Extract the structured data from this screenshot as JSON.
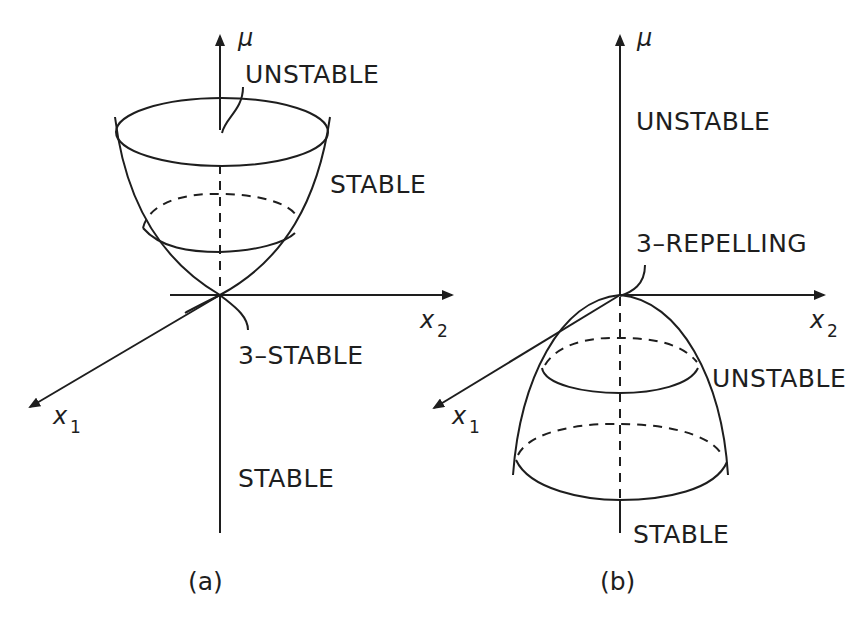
{
  "figure": {
    "panels": [
      {
        "id": "a",
        "caption": "(a)",
        "axes": {
          "vertical": "μ",
          "horizontal": "x",
          "horizontal_sub": "2",
          "depth": "x",
          "depth_sub": "1"
        },
        "labels": {
          "upper_axis": "UNSTABLE",
          "surface": "STABLE",
          "origin": "3–STABLE",
          "lower_axis": "STABLE"
        }
      },
      {
        "id": "b",
        "caption": "(b)",
        "axes": {
          "vertical": "μ",
          "horizontal": "x",
          "horizontal_sub": "2",
          "depth": "x",
          "depth_sub": "1"
        },
        "labels": {
          "upper_axis": "UNSTABLE",
          "origin": "3–REPELLING",
          "surface": "UNSTABLE",
          "lower_axis": "STABLE"
        }
      }
    ],
    "colors": {
      "ink": "#1e1e1e",
      "background": "#ffffff"
    }
  }
}
